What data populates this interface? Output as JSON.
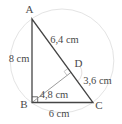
{
  "figure": {
    "type": "right-triangle-with-altitude",
    "vertices": {
      "a": "A",
      "b": "B",
      "c": "C",
      "d": "D"
    },
    "measurements": {
      "ab": "8 cm",
      "ad": "6,4 cm",
      "dc": "3,6 cm",
      "bd": "4,8 cm",
      "bc": "6 cm"
    },
    "colors": {
      "background": "#ffffff",
      "triangle_stroke": "#454545",
      "altitude_stroke": "#919191",
      "construction_circle": "#e4e4e4",
      "right_angle_mark_b": "#5a5a5a",
      "right_angle_mark_d": "#c4c4c4",
      "label_text": "#4a4a4a"
    }
  }
}
